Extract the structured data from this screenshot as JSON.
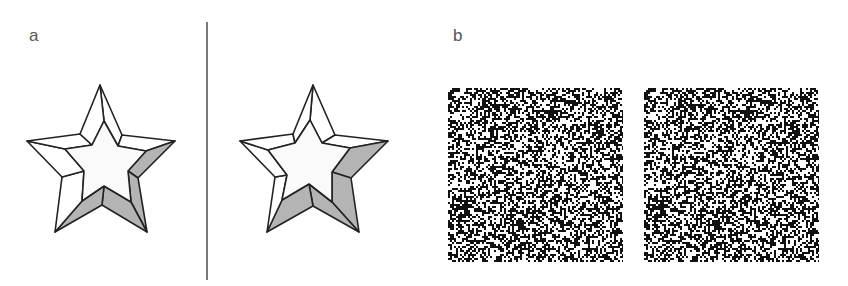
{
  "figure": {
    "panels": [
      {
        "id": "a",
        "label": "a",
        "content": "line-drawing stereo pair of a beveled five-pointed star"
      },
      {
        "id": "b",
        "label": "b",
        "content": "random-dot stereogram pair"
      }
    ]
  },
  "colors": {
    "stroke": "#222222",
    "shade": "#b4b4b4",
    "face": "#fafafa",
    "divider": "#7a7a7a",
    "label": "#555555",
    "dot": "#111111"
  },
  "stars": [
    {
      "name": "left-eye-star",
      "outer": [
        [
          100,
          85
        ],
        [
          122,
          135
        ],
        [
          175,
          141
        ],
        [
          138,
          178
        ],
        [
          147,
          232
        ],
        [
          102,
          205
        ],
        [
          55,
          232
        ],
        [
          62,
          177
        ],
        [
          27,
          141
        ],
        [
          80,
          134
        ]
      ],
      "inner": [
        [
          104,
          121
        ],
        [
          118,
          146
        ],
        [
          146,
          151
        ],
        [
          128,
          171
        ],
        [
          131,
          202
        ],
        [
          104,
          186
        ],
        [
          82,
          201
        ],
        [
          84,
          171
        ],
        [
          65,
          149
        ],
        [
          92,
          145
        ]
      ]
    },
    {
      "name": "right-eye-star",
      "outer": [
        [
          313,
          85
        ],
        [
          335,
          135
        ],
        [
          388,
          141
        ],
        [
          351,
          178
        ],
        [
          359,
          232
        ],
        [
          313,
          206
        ],
        [
          267,
          232
        ],
        [
          275,
          177
        ],
        [
          240,
          141
        ],
        [
          293,
          134
        ]
      ],
      "inner": [
        [
          310,
          120
        ],
        [
          322,
          143
        ],
        [
          350,
          148
        ],
        [
          332,
          172
        ],
        [
          332,
          202
        ],
        [
          309,
          184
        ],
        [
          282,
          200
        ],
        [
          287,
          175
        ],
        [
          268,
          150
        ],
        [
          295,
          143
        ]
      ]
    }
  ],
  "shaded_faces": [
    2,
    3,
    4,
    5
  ],
  "rds": {
    "width": 175,
    "height": 174,
    "cell": 2,
    "density": 0.5,
    "seed": 1337,
    "disparity_cells": 3,
    "inner_square": {
      "x0": 22,
      "y0": 22,
      "x1": 66,
      "y1": 66
    }
  }
}
